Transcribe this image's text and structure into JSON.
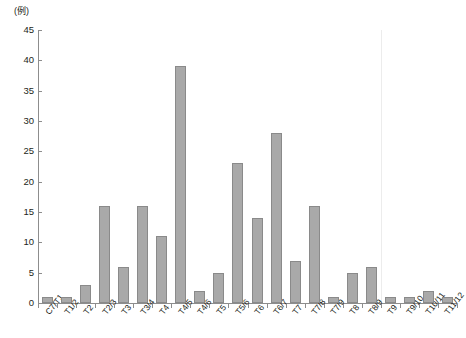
{
  "chart_data": {
    "type": "bar",
    "title": "",
    "subtitle": "",
    "xlabel": "",
    "ylabel": "(例)",
    "y_unit_label": "(例)",
    "ylim": [
      0,
      45
    ],
    "ytick_step": 5,
    "yticks": [
      0,
      5,
      10,
      15,
      20,
      25,
      30,
      35,
      40,
      45
    ],
    "grid": false,
    "legend": "none",
    "bar_color": "#a9a9a9",
    "bar_border_color": "#8a8a8a",
    "axis_color": "#8d8d8d",
    "text_color": "#231f20",
    "categories": [
      "C7/T1",
      "T1/2",
      "T2",
      "T2/3",
      "T3",
      "T3/4",
      "T4",
      "T4/5",
      "T4/6",
      "T5",
      "T5/6",
      "T6",
      "T6/7",
      "T7",
      "T7/8",
      "T7/9",
      "T8",
      "T8/9",
      "T9",
      "T9/10",
      "T10/11",
      "T11/12"
    ],
    "values": [
      1,
      1,
      3,
      16,
      6,
      16,
      11,
      39,
      2,
      5,
      23,
      14,
      28,
      7,
      16,
      1,
      5,
      6,
      1,
      1,
      2,
      1
    ],
    "annotations": []
  }
}
